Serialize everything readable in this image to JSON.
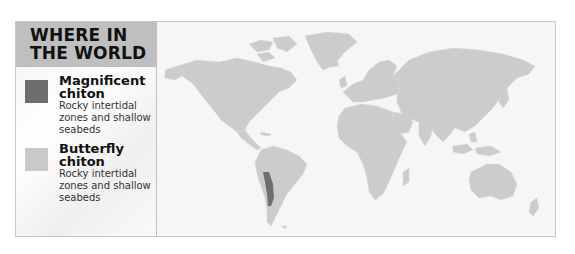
{
  "legend": {
    "title": "WHERE IN THE WORLD",
    "items": [
      {
        "name": "Magnificent chiton",
        "description": "Rocky intertidal zones and shallow seabeds",
        "color": "#6e6e6e"
      },
      {
        "name": "Butterfly chiton",
        "description": "Rocky intertidal zones and shallow seabeds",
        "color": "#c9c9c9"
      }
    ]
  },
  "map": {
    "land_color": "#cccccc",
    "ocean_color": "#f6f6f6",
    "highlight_region": "West coast of South America (Peru and Chile)",
    "highlight_color": "#6e6e6e"
  }
}
